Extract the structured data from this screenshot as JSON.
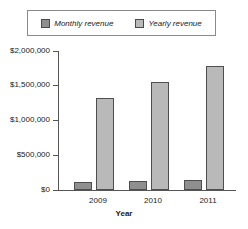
{
  "chart_data": {
    "type": "bar",
    "title": "",
    "xlabel": "Year",
    "ylabel": "",
    "categories": [
      "2009",
      "2010",
      "2011"
    ],
    "series": [
      {
        "name": "Monthly revenue",
        "color": "#8f8f8f",
        "values": [
          110000,
          125000,
          150000
        ],
        "value_labels": [
          "$110,000",
          "$125,000",
          "$150,000"
        ]
      },
      {
        "name": "Yearly revenue",
        "color": "#b9b9b9",
        "values": [
          1320000,
          1550000,
          1790000
        ],
        "value_labels": [
          "$1,320,000",
          "$1,550,000",
          "$1,790,000"
        ]
      }
    ],
    "ylim": [
      0,
      2000000
    ],
    "ytick_values": [
      0,
      500000,
      1000000,
      1500000,
      2000000
    ],
    "ytick_labels": [
      "$0",
      "$500,000",
      "$1,000,000",
      "$1,500,000",
      "$2,000,000"
    ],
    "grid": false,
    "legend_position": "top"
  },
  "legend": {
    "entries": [
      {
        "label": "Monthly revenue",
        "swatch": "#8f8f8f"
      },
      {
        "label": "Yearly revenue",
        "swatch": "#b9b9b9"
      }
    ]
  },
  "axes": {
    "y_labels": [
      "$2,000,000",
      "$1,500,000",
      "$1,000,000",
      "$500,000",
      "$0"
    ],
    "x_labels": [
      "2009",
      "2010",
      "2011"
    ],
    "x_title": "Year"
  }
}
